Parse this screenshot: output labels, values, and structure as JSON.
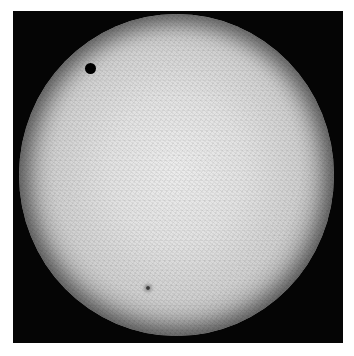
{
  "image": {
    "subject": "solar disk with transiting planet",
    "frame_color": "#050505",
    "disk_center_color": "#ececec",
    "disk_limb_color": "#141414",
    "planet_dot_color": "#000000"
  },
  "features": [
    {
      "name": "transiting-planet",
      "x": 91,
      "y": 68,
      "radius": 5
    },
    {
      "name": "sunspot",
      "x": 149,
      "y": 289,
      "radius": 2
    }
  ],
  "caption": {
    "text": ""
  }
}
